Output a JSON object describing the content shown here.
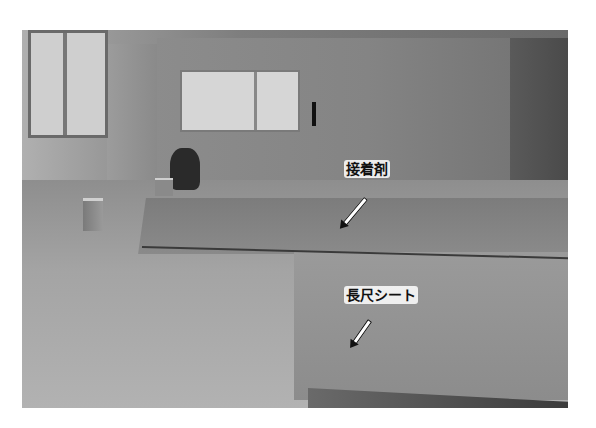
{
  "figure": {
    "labels": [
      {
        "id": "adhesive",
        "text": "接着剤"
      },
      {
        "id": "long-sheet",
        "text": "長尺シート"
      }
    ],
    "colors": {
      "label_bg": "#ffffff",
      "label_text": "#111111"
    }
  }
}
